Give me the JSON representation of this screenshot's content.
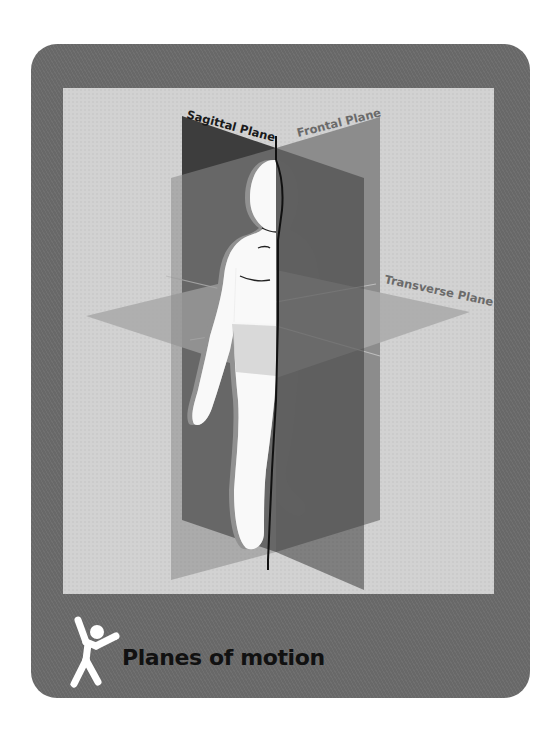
{
  "figure": {
    "title": "Planes of motion",
    "icon": "stick-figure-jumping-icon",
    "labels": {
      "sagittal": "Sagittal Plane",
      "frontal": "Frontal Plane",
      "transverse": "Transverse Plane"
    }
  },
  "colors": {
    "card": "#6b6b6b",
    "panel": "#d2d2d2",
    "sagittal_plane": "#3b3b3b",
    "frontal_plane": "#8a8a8a",
    "transverse_plane": "#a8a8a8",
    "body": "#ffffff",
    "label_dark": "#1a1a1a",
    "label_gray": "#6a6a6a"
  }
}
